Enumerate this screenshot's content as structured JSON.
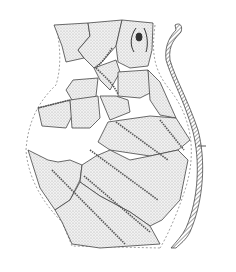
{
  "figure": {
    "background": "#ffffff",
    "ink": "#333333",
    "shade": "#d9d9d9",
    "caption": ""
  }
}
